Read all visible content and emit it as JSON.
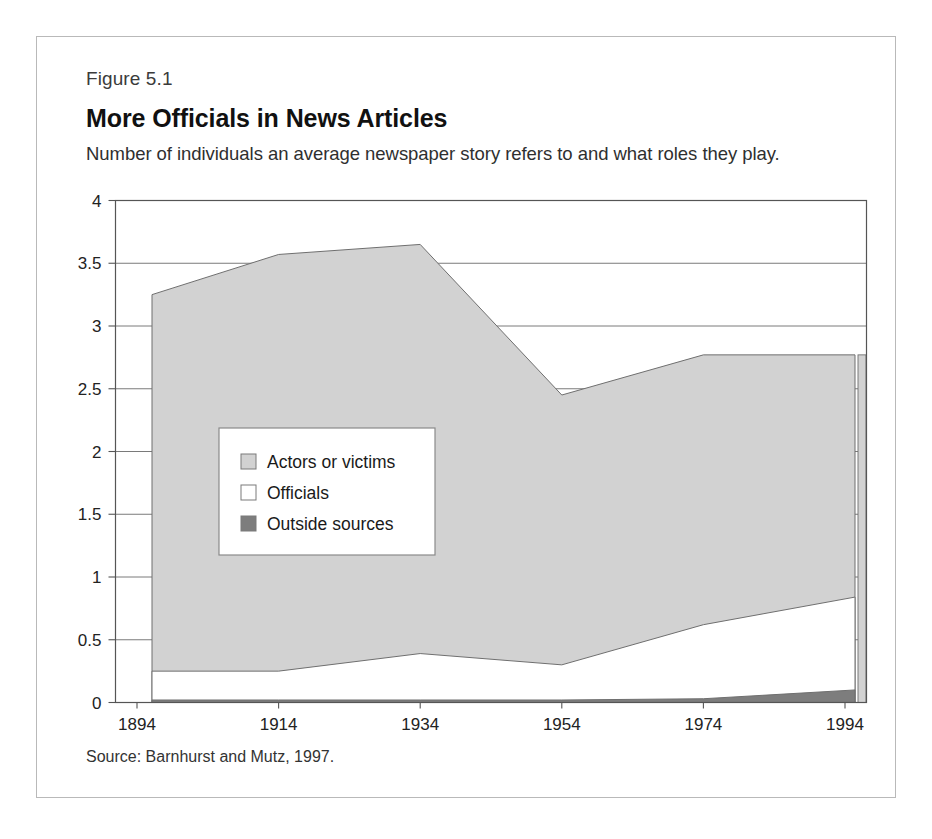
{
  "figure": {
    "number": "Figure 5.1",
    "title": "More Officials in News Articles",
    "subtitle": "Number of individuals an average newspaper story refers to and what roles they play.",
    "source": "Source: Barnhurst and Mutz, 1997."
  },
  "colors": {
    "actors_or_victims": "#d2d2d2",
    "officials": "#ffffff",
    "outside_sources": "#7d7d7d",
    "outline": "#6f6f6f",
    "gridline": "#6b6b6b",
    "axis": "#555555",
    "text": "#1a1a1a",
    "frame": "#b9b9b9"
  },
  "legend": {
    "position": "inside-left-middle",
    "entries": [
      {
        "label": "Actors or victims",
        "swatch": "#d2d2d2",
        "swatch_name": "swatch-actors-or-victims"
      },
      {
        "label": "Officials",
        "swatch": "#ffffff",
        "swatch_name": "swatch-officials"
      },
      {
        "label": "Outside sources",
        "swatch": "#7d7d7d",
        "swatch_name": "swatch-outside-sources"
      }
    ]
  },
  "chart_data": {
    "type": "area",
    "stacked": true,
    "title": "More Officials in News Articles",
    "subtitle": "Number of individuals an average newspaper story refers to and what roles they play.",
    "xlabel": "",
    "ylabel": "",
    "grid": true,
    "legend_position": "inside-left-middle",
    "x": [
      1894,
      1914,
      1934,
      1954,
      1974,
      1994
    ],
    "xlim": [
      1891,
      2000
    ],
    "ylim": [
      0,
      4
    ],
    "xticks": [
      1894,
      1914,
      1934,
      1954,
      1974,
      1994
    ],
    "xtick_labels": [
      "1894",
      "1914",
      "1934",
      "1954",
      "1974",
      "1994"
    ],
    "yticks": [
      0,
      0.5,
      1,
      1.5,
      2,
      2.5,
      3,
      3.5,
      4
    ],
    "ytick_labels": [
      "0",
      "0.5",
      "1",
      "1.5",
      "2",
      "2.5",
      "3",
      "3.5",
      "4"
    ],
    "series": [
      {
        "name": "Outside sources",
        "color": "#7d7d7d",
        "values": [
          0.02,
          0.02,
          0.02,
          0.02,
          0.03,
          0.1
        ]
      },
      {
        "name": "Officials",
        "color": "#ffffff",
        "values": [
          0.23,
          0.23,
          0.37,
          0.28,
          0.59,
          0.74
        ]
      },
      {
        "name": "Actors or victims",
        "color": "#d2d2d2",
        "values": [
          3.0,
          3.32,
          3.26,
          2.15,
          2.15,
          1.93
        ]
      }
    ],
    "cumulative_tops": {
      "outside_sources": [
        0.02,
        0.02,
        0.02,
        0.02,
        0.03,
        0.1
      ],
      "officials": [
        0.25,
        0.25,
        0.39,
        0.3,
        0.62,
        0.84
      ],
      "total": [
        3.25,
        3.57,
        3.65,
        2.45,
        2.77,
        2.77
      ]
    }
  }
}
